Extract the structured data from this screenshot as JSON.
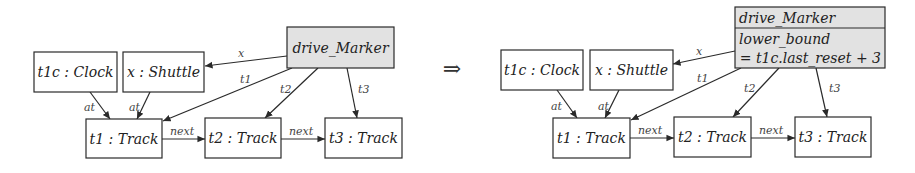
{
  "figure": {
    "implies_symbol": "⇒",
    "implies_pos": {
      "x": 452,
      "y": 76
    }
  },
  "left": {
    "nodes": [
      {
        "id": "t1c",
        "label": "t1c : Clock",
        "x": 34,
        "y": 52,
        "w": 83,
        "h": 40,
        "highlight": false
      },
      {
        "id": "x",
        "label": "x : Shuttle",
        "x": 123,
        "y": 52,
        "w": 81,
        "h": 40,
        "highlight": false
      },
      {
        "id": "dm",
        "label": "drive_Marker",
        "x": 287,
        "y": 27,
        "w": 107,
        "h": 41,
        "highlight": true
      },
      {
        "id": "t1",
        "label": "t1 : Track",
        "x": 86,
        "y": 119,
        "w": 76,
        "h": 39,
        "highlight": false
      },
      {
        "id": "t2",
        "label": "t2 : Track",
        "x": 205,
        "y": 118,
        "w": 76,
        "h": 40,
        "highlight": false
      },
      {
        "id": "t3",
        "label": "t3 : Track",
        "x": 325,
        "y": 118,
        "w": 77,
        "h": 40,
        "highlight": false
      }
    ],
    "edges": [
      {
        "label": "x",
        "x1": 287,
        "y1": 56,
        "x2": 205,
        "y2": 66,
        "lx": 238,
        "ly": 57
      },
      {
        "label": "t1",
        "x1": 292,
        "y1": 68,
        "x2": 163,
        "y2": 121,
        "lx": 240,
        "ly": 83
      },
      {
        "label": "t2",
        "x1": 318,
        "y1": 68,
        "x2": 265,
        "y2": 118,
        "lx": 280,
        "ly": 93
      },
      {
        "label": "t3",
        "x1": 347,
        "y1": 68,
        "x2": 357,
        "y2": 118,
        "lx": 358,
        "ly": 93
      },
      {
        "label": "at",
        "x1": 90,
        "y1": 92,
        "x2": 110,
        "y2": 119,
        "lx": 84,
        "ly": 111
      },
      {
        "label": "at",
        "x1": 150,
        "y1": 92,
        "x2": 137,
        "y2": 119,
        "lx": 129,
        "ly": 111
      },
      {
        "label": "next",
        "x1": 162,
        "y1": 139,
        "x2": 205,
        "y2": 139,
        "lx": 170,
        "ly": 135
      },
      {
        "label": "next",
        "x1": 281,
        "y1": 139,
        "x2": 325,
        "y2": 139,
        "lx": 289,
        "ly": 135
      }
    ]
  },
  "right": {
    "nodes": [
      {
        "id": "t1c",
        "label": "t1c : Clock",
        "x": 501,
        "y": 50,
        "w": 82,
        "h": 40,
        "highlight": false
      },
      {
        "id": "x",
        "label": "x : Shuttle",
        "x": 590,
        "y": 50,
        "w": 83,
        "h": 40,
        "highlight": false
      },
      {
        "id": "t1",
        "label": "t1 : Track",
        "x": 553,
        "y": 118,
        "w": 77,
        "h": 40,
        "highlight": false
      },
      {
        "id": "t2",
        "label": "t2 : Track",
        "x": 674,
        "y": 117,
        "w": 77,
        "h": 40,
        "highlight": false
      },
      {
        "id": "t3",
        "label": "t3 : Track",
        "x": 795,
        "y": 117,
        "w": 76,
        "h": 40,
        "highlight": false
      }
    ],
    "marker": {
      "x": 735,
      "y": 7,
      "w": 150,
      "h": 61,
      "divider_y": 28,
      "title": "drive_Marker",
      "attribute_name": "lower_bound",
      "attribute_expr": "= t1c.last_reset + 3"
    },
    "edges": [
      {
        "label": "x",
        "x1": 735,
        "y1": 51,
        "x2": 673,
        "y2": 64,
        "lx": 696,
        "ly": 55
      },
      {
        "label": "t1",
        "x1": 741,
        "y1": 68,
        "x2": 631,
        "y2": 120,
        "lx": 697,
        "ly": 82
      },
      {
        "label": "t2",
        "x1": 779,
        "y1": 68,
        "x2": 733,
        "y2": 117,
        "lx": 744,
        "ly": 92
      },
      {
        "label": "t3",
        "x1": 816,
        "y1": 68,
        "x2": 827,
        "y2": 117,
        "lx": 829,
        "ly": 92
      },
      {
        "label": "at",
        "x1": 557,
        "y1": 90,
        "x2": 577,
        "y2": 118,
        "lx": 551,
        "ly": 110
      },
      {
        "label": "at",
        "x1": 619,
        "y1": 90,
        "x2": 605,
        "y2": 118,
        "lx": 598,
        "ly": 110
      },
      {
        "label": "next",
        "x1": 630,
        "y1": 138,
        "x2": 674,
        "y2": 138,
        "lx": 638,
        "ly": 134
      },
      {
        "label": "next",
        "x1": 751,
        "y1": 138,
        "x2": 795,
        "y2": 138,
        "lx": 759,
        "ly": 134
      }
    ]
  }
}
